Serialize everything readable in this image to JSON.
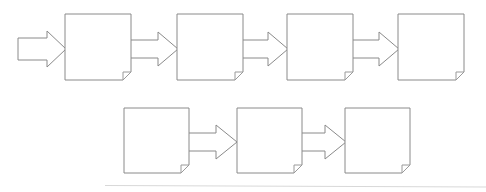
{
  "diagram": {
    "type": "flowchart",
    "background_color": "#ffffff",
    "line_color": "#8a8a8a",
    "fill_color": "#ffffff",
    "artifact_line_color": "#d8d8d8",
    "node_shape": "document-box-with-folded-corner",
    "node_label": "",
    "rows": [
      {
        "name": "row-1",
        "nodes": [
          {
            "id": "node-1",
            "label": "",
            "x": 65,
            "y": 14,
            "w": 66,
            "h": 66
          },
          {
            "id": "node-2",
            "label": "",
            "x": 177,
            "y": 14,
            "w": 66,
            "h": 66
          },
          {
            "id": "node-3",
            "label": "",
            "x": 287,
            "y": 14,
            "w": 66,
            "h": 66
          },
          {
            "id": "node-4",
            "label": "",
            "x": 398,
            "y": 14,
            "w": 66,
            "h": 66
          }
        ]
      },
      {
        "name": "row-2",
        "nodes": [
          {
            "id": "node-5",
            "label": "",
            "x": 124,
            "y": 108,
            "w": 65,
            "h": 65
          },
          {
            "id": "node-6",
            "label": "",
            "x": 237,
            "y": 108,
            "w": 65,
            "h": 65
          },
          {
            "id": "node-7",
            "label": "",
            "x": 345,
            "y": 108,
            "w": 65,
            "h": 65
          }
        ]
      }
    ],
    "connectors": [
      {
        "id": "entry-arrow",
        "kind": "block-arrow",
        "direction": "right",
        "from": "",
        "to": "node-1",
        "x1": 18,
        "x2": 65,
        "cy": 49
      },
      {
        "id": "arrow-1-2",
        "kind": "block-arrow",
        "direction": "right",
        "from": "node-1",
        "to": "node-2",
        "x1": 131,
        "x2": 177,
        "cy": 49
      },
      {
        "id": "arrow-2-3",
        "kind": "block-arrow",
        "direction": "right",
        "from": "node-2",
        "to": "node-3",
        "x1": 243,
        "x2": 287,
        "cy": 49
      },
      {
        "id": "arrow-3-4",
        "kind": "block-arrow",
        "direction": "right",
        "from": "node-3",
        "to": "node-4",
        "x1": 353,
        "x2": 398,
        "cy": 49
      },
      {
        "id": "arrow-5-6",
        "kind": "block-arrow",
        "direction": "right",
        "from": "node-5",
        "to": "node-6",
        "x1": 189,
        "x2": 237,
        "cy": 142
      },
      {
        "id": "arrow-6-7",
        "kind": "block-arrow",
        "direction": "right",
        "from": "node-6",
        "to": "node-7",
        "x1": 302,
        "x2": 345,
        "cy": 142
      }
    ],
    "artifact": {
      "id": "scan-line",
      "x1": 105,
      "y1": 185,
      "x2": 486,
      "y2": 187
    }
  }
}
